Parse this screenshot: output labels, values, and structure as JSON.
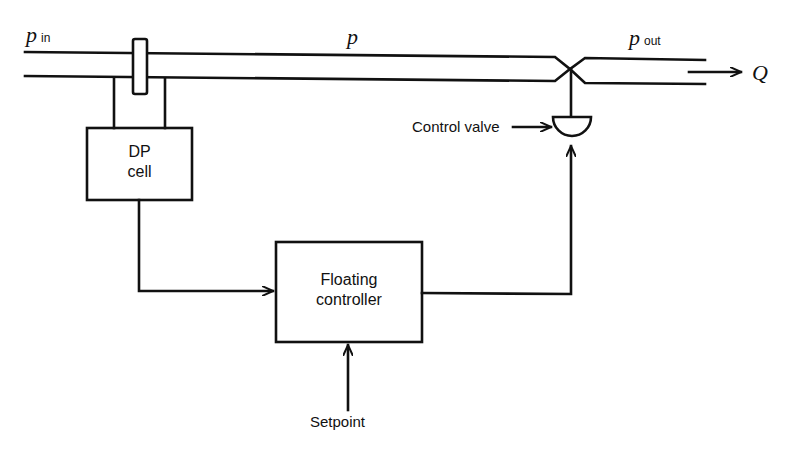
{
  "diagram": {
    "type": "process control block diagram",
    "pipe_labels": {
      "inlet_symbol": "p",
      "inlet_subscript": "in",
      "middle_symbol": "p",
      "outlet_symbol": "p",
      "outlet_subscript": "out",
      "flow_symbol": "Q"
    },
    "blocks": {
      "dp_cell": {
        "line1": "DP",
        "line2": "cell"
      },
      "controller": {
        "line1": "Floating",
        "line2": "controller"
      }
    },
    "labels": {
      "control_valve": "Control valve",
      "setpoint": "Setpoint"
    },
    "colors": {
      "stroke": "#111111",
      "background": "#ffffff"
    }
  }
}
